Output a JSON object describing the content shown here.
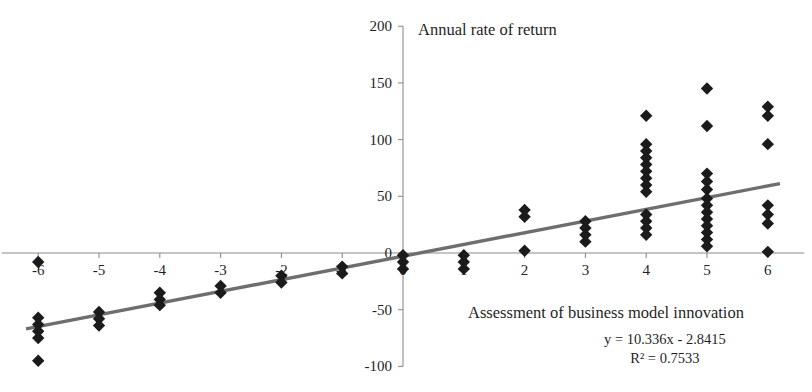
{
  "chart_data": {
    "type": "scatter",
    "title": "",
    "xlabel": "Assessment of business model innovation",
    "ylabel": "Annual rate of return",
    "xlim": [
      -6.6,
      6.6
    ],
    "ylim": [
      -100,
      200
    ],
    "xticks": [
      -6,
      -5,
      -4,
      -3,
      -2,
      -1,
      0,
      1,
      2,
      3,
      4,
      5,
      6
    ],
    "xticklabels": [
      "-6",
      "-5",
      "-4",
      "-3",
      "-2",
      "-1",
      "0",
      "1",
      "2",
      "3",
      "4",
      "5",
      "6"
    ],
    "yticks": [
      -100,
      -50,
      0,
      50,
      100,
      150,
      200
    ],
    "yticklabels": [
      "-100",
      "-50",
      "0",
      "50",
      "100",
      "150",
      "200"
    ],
    "grid": false,
    "legend": false,
    "marker": "diamond",
    "marker_color": "#1b1b1b",
    "trendline_color": "#6e6e6e",
    "equation": "y = 10.336x - 2.8415",
    "r_squared": "R² = 0.7533",
    "fit": {
      "slope": 10.336,
      "intercept": -2.8415,
      "r2": 0.7533
    },
    "trendline_x_range": [
      -6.2,
      6.2
    ],
    "points": [
      {
        "x": -6,
        "y": -8
      },
      {
        "x": -6,
        "y": -57
      },
      {
        "x": -6,
        "y": -63
      },
      {
        "x": -6,
        "y": -69
      },
      {
        "x": -6,
        "y": -75
      },
      {
        "x": -6,
        "y": -95
      },
      {
        "x": -5,
        "y": -52
      },
      {
        "x": -5,
        "y": -58
      },
      {
        "x": -5,
        "y": -64
      },
      {
        "x": -4,
        "y": -35
      },
      {
        "x": -4,
        "y": -41
      },
      {
        "x": -4,
        "y": -46
      },
      {
        "x": -3,
        "y": -29
      },
      {
        "x": -3,
        "y": -35
      },
      {
        "x": -2,
        "y": -20
      },
      {
        "x": -2,
        "y": -26
      },
      {
        "x": -1,
        "y": -12
      },
      {
        "x": -1,
        "y": -18
      },
      {
        "x": 0,
        "y": -2
      },
      {
        "x": 0,
        "y": -8
      },
      {
        "x": 0,
        "y": -14
      },
      {
        "x": 1,
        "y": -2
      },
      {
        "x": 1,
        "y": -8
      },
      {
        "x": 1,
        "y": -14
      },
      {
        "x": 2,
        "y": 38
      },
      {
        "x": 2,
        "y": 32
      },
      {
        "x": 2,
        "y": 2
      },
      {
        "x": 3,
        "y": 28
      },
      {
        "x": 3,
        "y": 22
      },
      {
        "x": 3,
        "y": 16
      },
      {
        "x": 3,
        "y": 10
      },
      {
        "x": 4,
        "y": 121
      },
      {
        "x": 4,
        "y": 96
      },
      {
        "x": 4,
        "y": 90
      },
      {
        "x": 4,
        "y": 84
      },
      {
        "x": 4,
        "y": 78
      },
      {
        "x": 4,
        "y": 72
      },
      {
        "x": 4,
        "y": 66
      },
      {
        "x": 4,
        "y": 60
      },
      {
        "x": 4,
        "y": 54
      },
      {
        "x": 4,
        "y": 34
      },
      {
        "x": 4,
        "y": 28
      },
      {
        "x": 4,
        "y": 22
      },
      {
        "x": 4,
        "y": 16
      },
      {
        "x": 5,
        "y": 145
      },
      {
        "x": 5,
        "y": 112
      },
      {
        "x": 5,
        "y": 70
      },
      {
        "x": 5,
        "y": 63
      },
      {
        "x": 5,
        "y": 56
      },
      {
        "x": 5,
        "y": 48
      },
      {
        "x": 5,
        "y": 42
      },
      {
        "x": 5,
        "y": 36
      },
      {
        "x": 5,
        "y": 30
      },
      {
        "x": 5,
        "y": 24
      },
      {
        "x": 5,
        "y": 18
      },
      {
        "x": 5,
        "y": 12
      },
      {
        "x": 5,
        "y": 6
      },
      {
        "x": 6,
        "y": 129
      },
      {
        "x": 6,
        "y": 121
      },
      {
        "x": 6,
        "y": 96
      },
      {
        "x": 6,
        "y": 42
      },
      {
        "x": 6,
        "y": 34
      },
      {
        "x": 6,
        "y": 26
      },
      {
        "x": 6,
        "y": 1
      }
    ]
  }
}
